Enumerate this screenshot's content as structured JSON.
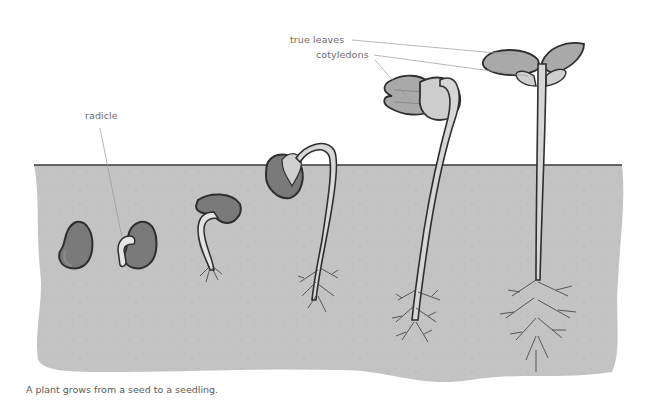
{
  "diagram": {
    "caption": "A plant grows from a seed to a seedling.",
    "labels": {
      "radicle": "radicle",
      "true_leaves": "true leaves",
      "cotyledons": "cotyledons"
    },
    "stages": [
      {
        "index": 1,
        "name": "seed"
      },
      {
        "index": 2,
        "name": "seed with radicle"
      },
      {
        "index": 3,
        "name": "germinating seed with root"
      },
      {
        "index": 4,
        "name": "hooked shoot emerging"
      },
      {
        "index": 5,
        "name": "shoot with cotyledons above soil"
      },
      {
        "index": 6,
        "name": "seedling with true leaves"
      }
    ],
    "colors": {
      "soil": "#c2c2c2",
      "soil_line": "#3a3a3a",
      "seed": "#7a7a7a",
      "seed_outline": "#2e2e2e",
      "stem": "#cfcfcf",
      "leaf": "#a9a9a9",
      "cotyledon_leaf": "#bdbdbd",
      "label_text": "#6b6b6b",
      "leader_line": "#9a9a9a"
    }
  }
}
